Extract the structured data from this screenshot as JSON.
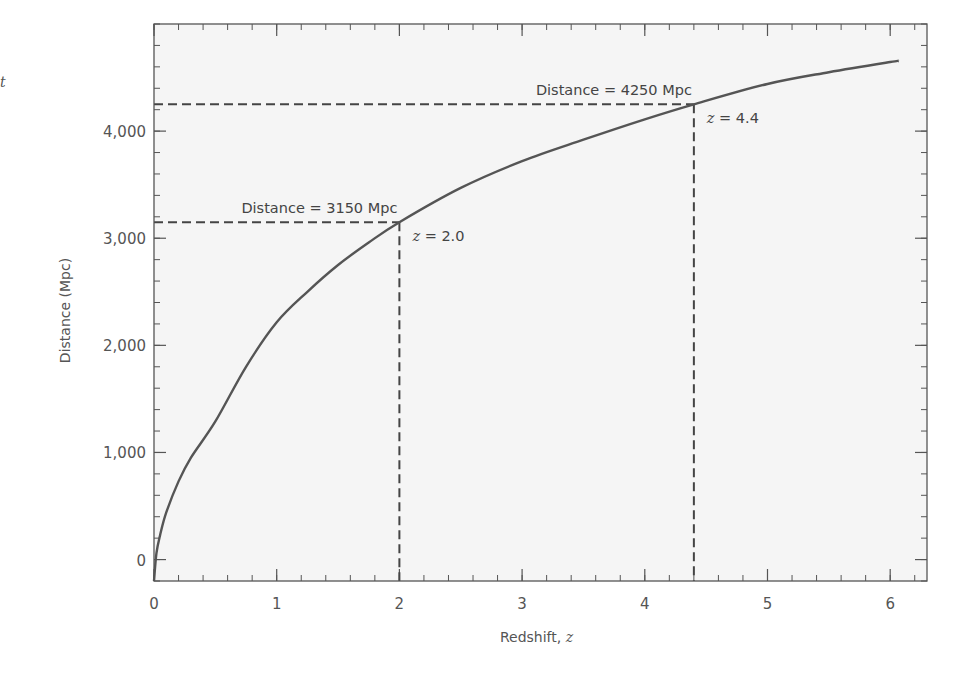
{
  "stray_text": "t",
  "chart_data": {
    "type": "line",
    "title": "",
    "xlabel": "Redshift, ",
    "xlabel_var": "z",
    "ylabel": "Distance (Mpc)",
    "xlim": [
      0,
      6.3
    ],
    "ylim": [
      -200,
      5000
    ],
    "grid": false,
    "legend": "none",
    "x_ticks": [
      0,
      1,
      2,
      3,
      4,
      5,
      6
    ],
    "x_tick_labels": [
      "0",
      "1",
      "2",
      "3",
      "4",
      "5",
      "6"
    ],
    "x_minor_step": 0.2,
    "y_ticks": [
      0,
      1000,
      2000,
      3000,
      4000
    ],
    "y_tick_labels": [
      "0",
      "1,000",
      "2,000",
      "3,000",
      "4,000"
    ],
    "y_minor_step": 200,
    "series": [
      {
        "name": "Distance vs redshift",
        "color": "#555555",
        "x": [
          0,
          0.02,
          0.05,
          0.1,
          0.2,
          0.3,
          0.5,
          0.75,
          1.0,
          1.25,
          1.5,
          1.75,
          2.0,
          2.5,
          3.0,
          3.5,
          4.0,
          4.4,
          5.0,
          5.5,
          6.0,
          6.07
        ],
        "y": [
          -200,
          60,
          230,
          440,
          730,
          950,
          1290,
          1800,
          2215,
          2500,
          2750,
          2960,
          3150,
          3470,
          3720,
          3920,
          4110,
          4250,
          4440,
          4550,
          4645,
          4655
        ]
      }
    ],
    "annotations": [
      {
        "z": 2.0,
        "distance": 3150,
        "distance_label": "Distance = 3150 Mpc",
        "z_label_var": "z",
        "z_label_rest": " = 2.0"
      },
      {
        "z": 4.4,
        "distance": 4250,
        "distance_label": "Distance = 4250 Mpc",
        "z_label_var": "z",
        "z_label_rest": " = 4.4"
      }
    ],
    "colors": {
      "background": "#f5f5f5",
      "axis": "#555555",
      "curve": "#555555",
      "dash": "#444444"
    }
  }
}
